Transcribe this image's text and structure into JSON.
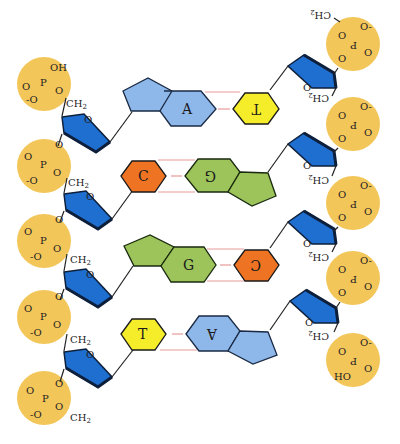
{
  "diagram": {
    "colors": {
      "phosphate": "#f3c65a",
      "sugar": "#1f6fd1",
      "sugar_edge": "#0d1f3a",
      "adenine": "#8fb8ea",
      "thymine": "#f5ec2a",
      "cytosine": "#ee7424",
      "guanine": "#9cc45a",
      "hydrogen_bond": "#e89a9a"
    },
    "left_strand": {
      "phosphates": [
        {
          "top": "OH",
          "left": "O",
          "bottom": "-O",
          "center": "P",
          "link": "O"
        },
        {
          "top": "O",
          "left": "O",
          "bottom": "-O",
          "center": "P",
          "link": "O"
        },
        {
          "top": "O",
          "left": "O",
          "bottom": "-O",
          "center": "P",
          "link": "O"
        },
        {
          "top": "O",
          "left": "O",
          "bottom": "-O",
          "center": "P",
          "link": "O"
        },
        {
          "top": "O",
          "left": "O",
          "bottom": "-O",
          "center": "P",
          "link": "O"
        }
      ],
      "ch2_label": "CH2",
      "ring_oxygen": "O"
    },
    "right_strand": {
      "ch2_label": "CH2",
      "ring_oxygen": "O",
      "terminal": "HO"
    },
    "base_pairs": [
      {
        "left": "A",
        "right": "T",
        "hbonds": 2
      },
      {
        "left": "C",
        "right": "G",
        "hbonds": 3
      },
      {
        "left": "G",
        "right": "C",
        "hbonds": 3
      },
      {
        "left": "T",
        "right": "A",
        "hbonds": 2
      }
    ]
  }
}
